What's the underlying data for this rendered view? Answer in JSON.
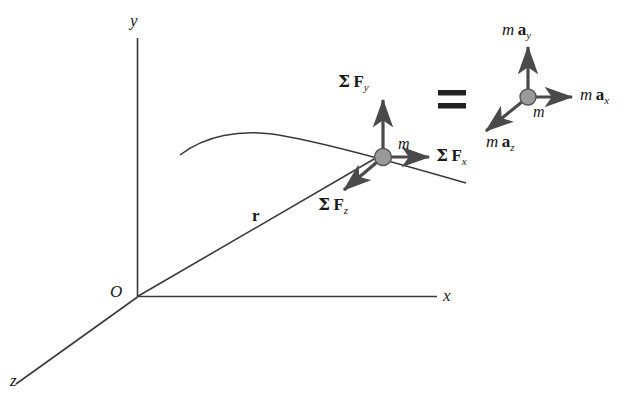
{
  "figure": {
    "background_color": "#ffffff",
    "line_color": "#3a3a3a",
    "vector_color": "#4a4a4a",
    "text_color": "#1a1a1a",
    "particle_fill": "#9a9a9a",
    "particle_stroke": "#555555"
  },
  "axes": {
    "y_label": "y",
    "x_label": "x",
    "z_label": "z",
    "origin_label": "O"
  },
  "position_vector": {
    "label": "r"
  },
  "free_body": {
    "mass_label": "m",
    "force_y": {
      "sigma": "Σ",
      "symbol": "F",
      "subscript": "y"
    },
    "force_x": {
      "sigma": "Σ",
      "symbol": "F",
      "subscript": "x"
    },
    "force_z": {
      "sigma": "Σ",
      "symbol": "F",
      "subscript": "z"
    }
  },
  "equals_sign": "=",
  "kinetic_diagram": {
    "mass_label": "m",
    "accel_y": {
      "mass": "m",
      "symbol": "a",
      "subscript": "y"
    },
    "accel_x": {
      "mass": "m",
      "symbol": "a",
      "subscript": "x"
    },
    "accel_z": {
      "mass": "m",
      "symbol": "a",
      "subscript": "z"
    }
  }
}
